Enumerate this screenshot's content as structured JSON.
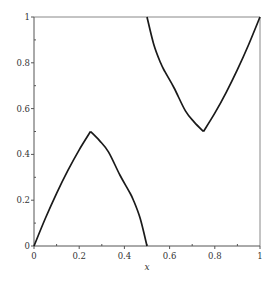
{
  "chart_data": {
    "type": "line",
    "title": "",
    "xlabel": "x",
    "ylabel": "",
    "xlim": [
      0,
      1
    ],
    "ylim": [
      0,
      1
    ],
    "grid": false,
    "legend": null,
    "x_ticks": [
      "0",
      "0.2",
      "0.4",
      "0.6",
      "0.8",
      "1"
    ],
    "y_ticks": [
      "0",
      "0.2",
      "0.4",
      "0.6",
      "0.8",
      "1"
    ],
    "series": [
      {
        "name": "left-branch",
        "color": "#1a1a1a",
        "x": [
          0,
          0.05,
          0.1,
          0.15,
          0.2,
          0.25,
          0.29,
          0.33,
          0.38,
          0.42,
          0.44,
          0.47,
          0.5
        ],
        "y": [
          0,
          0.12,
          0.23,
          0.33,
          0.42,
          0.5,
          0.46,
          0.41,
          0.31,
          0.24,
          0.2,
          0.12,
          0
        ]
      },
      {
        "name": "right-branch",
        "color": "#1a1a1a",
        "x": [
          0.5,
          0.53,
          0.56,
          0.58,
          0.62,
          0.67,
          0.71,
          0.75,
          0.8,
          0.85,
          0.9,
          0.95,
          1.0
        ],
        "y": [
          1.0,
          0.88,
          0.8,
          0.76,
          0.69,
          0.59,
          0.54,
          0.5,
          0.58,
          0.67,
          0.77,
          0.88,
          1.0
        ]
      }
    ]
  },
  "plot": {
    "frame": {
      "left": 34,
      "right": 260,
      "top": 17,
      "bottom": 246
    },
    "colors": {
      "axis": "#555555",
      "frame": "#888888",
      "curve": "#1a1a1a"
    }
  }
}
